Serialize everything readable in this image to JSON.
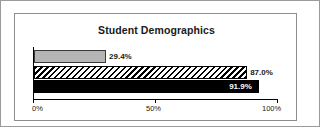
{
  "frame": {
    "outer_border_color": "#9a9a9a",
    "inner_border_color": "#8d8d8d"
  },
  "chart_data": {
    "type": "bar",
    "orientation": "horizontal",
    "title": "Student Demographics",
    "xlabel": "",
    "ylabel": "",
    "xlim": [
      0,
      100
    ],
    "grid": false,
    "legend": "none",
    "categories": [
      "series-1",
      "series-2",
      "series-3"
    ],
    "values": [
      29.4,
      87.0,
      91.9
    ],
    "data_labels": [
      "29.4%",
      "87.0%",
      "91.9%"
    ],
    "label_positions": [
      "outside",
      "outside",
      "inside"
    ],
    "bar_styles": [
      "solid-gray",
      "diagonal-hatch",
      "solid-black"
    ],
    "bar_colors": [
      "#b5b5b5",
      "#000000",
      "#000000"
    ],
    "xticks": [
      0,
      50,
      100
    ],
    "xtick_labels": [
      "0%",
      "50%",
      "100%"
    ]
  }
}
